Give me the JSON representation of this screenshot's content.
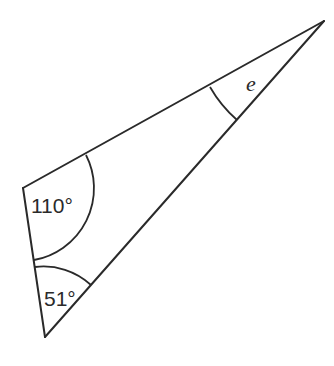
{
  "diagram": {
    "type": "triangle",
    "vertices": {
      "left": {
        "x": 23,
        "y": 188
      },
      "bottom": {
        "x": 45,
        "y": 337
      },
      "top_right": {
        "x": 324,
        "y": 21
      }
    },
    "angles": [
      {
        "vertex": "left",
        "label": "110°",
        "value": 110
      },
      {
        "vertex": "bottom",
        "label": "51°",
        "value": 51
      },
      {
        "vertex": "top_right",
        "label": "e",
        "value": null,
        "unknown": true
      }
    ],
    "stroke_color": "#2a2a2a",
    "background_color": "#ffffff"
  },
  "labels": {
    "angle_left": "110°",
    "angle_bottom": "51°",
    "angle_top_right": "e"
  }
}
